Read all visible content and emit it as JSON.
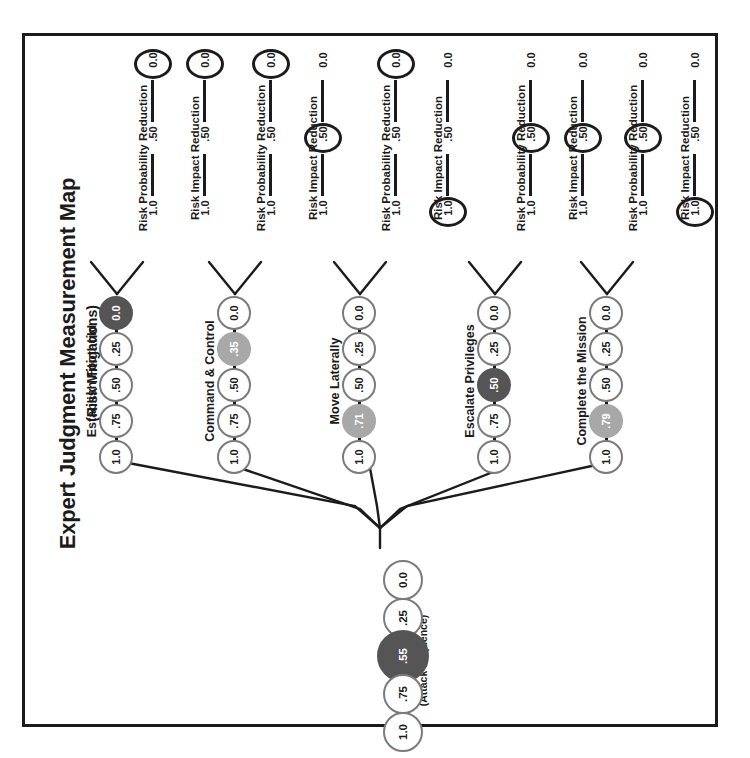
{
  "title": {
    "main": "Expert Judgment Measurement Map",
    "sub": "(Risk Mitigations)"
  },
  "scale_ticks": {
    "high": "1.0",
    "mid": ".50",
    "low": "0.0"
  },
  "scales": [
    {
      "label": "Risk Probability Reduction",
      "selected": "0.0",
      "construct": "Establish Foothold"
    },
    {
      "label": "Risk Impact Reduction",
      "selected": "0.0",
      "construct": "Establish Foothold"
    },
    {
      "label": "Risk Probability Reduction",
      "selected": "0.0",
      "construct": "Command & Control"
    },
    {
      "label": "Risk Impact Reduction",
      "selected": ".50",
      "construct": "Command & Control"
    },
    {
      "label": "Risk Probability Reduction",
      "selected": "0.0",
      "construct": "Move Laterally"
    },
    {
      "label": "Risk Impact Reduction",
      "selected": "1.0",
      "construct": "Move Laterally"
    },
    {
      "label": "Risk Probability Reduction",
      "selected": ".50",
      "construct": "Escalate Privileges"
    },
    {
      "label": "Risk Impact Reduction",
      "selected": ".50",
      "construct": "Escalate Privileges"
    },
    {
      "label": "Risk Probability Reduction",
      "selected": ".50",
      "construct": "Complete the Mission"
    },
    {
      "label": "Risk Impact Reduction",
      "selected": "1.0",
      "construct": "Complete the Mission"
    }
  ],
  "constructs": [
    {
      "label": "Establish Foothold",
      "nodes": [
        {
          "value": "0.0",
          "fill": "dark"
        },
        {
          "value": ".25",
          "fill": "none"
        },
        {
          "value": ".50",
          "fill": "none"
        },
        {
          "value": ".75",
          "fill": "none"
        },
        {
          "value": "1.0",
          "fill": "none"
        }
      ]
    },
    {
      "label": "Command & Control",
      "nodes": [
        {
          "value": "0.0",
          "fill": "none"
        },
        {
          "value": ".35",
          "fill": "gray"
        },
        {
          "value": ".50",
          "fill": "none"
        },
        {
          "value": ".75",
          "fill": "none"
        },
        {
          "value": "1.0",
          "fill": "none"
        }
      ]
    },
    {
      "label": "Move Laterally",
      "nodes": [
        {
          "value": "0.0",
          "fill": "none"
        },
        {
          "value": ".25",
          "fill": "none"
        },
        {
          "value": ".50",
          "fill": "none"
        },
        {
          "value": ".71",
          "fill": "gray"
        },
        {
          "value": "1.0",
          "fill": "none"
        }
      ]
    },
    {
      "label": "Escalate Privileges",
      "nodes": [
        {
          "value": "0.0",
          "fill": "none"
        },
        {
          "value": ".25",
          "fill": "none"
        },
        {
          "value": ".50",
          "fill": "dark"
        },
        {
          "value": ".75",
          "fill": "none"
        },
        {
          "value": "1.0",
          "fill": "none"
        }
      ]
    },
    {
      "label": "Complete the Mission",
      "nodes": [
        {
          "value": "0.0",
          "fill": "none"
        },
        {
          "value": ".25",
          "fill": "none"
        },
        {
          "value": ".50",
          "fill": "none"
        },
        {
          "value": ".79",
          "fill": "gray"
        },
        {
          "value": "1.0",
          "fill": "none"
        }
      ]
    }
  ],
  "root": {
    "label_main": "Risk Mitigations",
    "label_sub": "(Attack Sequence)",
    "nodes": [
      {
        "value": "0.0",
        "fill": "none",
        "big": false
      },
      {
        "value": ".25",
        "fill": "none",
        "big": false
      },
      {
        "value": ".55",
        "fill": "dark",
        "big": true
      },
      {
        "value": ".75",
        "fill": "none",
        "big": false
      },
      {
        "value": "1.0",
        "fill": "none",
        "big": false
      }
    ]
  },
  "colors": {
    "ink": "#1b1b1b",
    "node_stroke": "#7b7b7b",
    "fill_dark": "#555555",
    "fill_gray": "#a8a8a8"
  }
}
